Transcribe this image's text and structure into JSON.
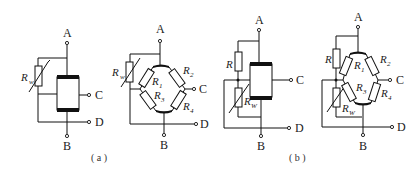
{
  "figure": {
    "caption_a": "( a )",
    "caption_b": "( b )",
    "terminals": {
      "A": "A",
      "B": "B",
      "C": "C",
      "D": "D"
    },
    "components": {
      "rw_main": "R",
      "rw_sub": "w",
      "r": "R",
      "r1_main": "R",
      "r1_sub": "1",
      "r2_main": "R",
      "r2_sub": "2",
      "r3_main": "R",
      "r3_sub": "3",
      "r4_main": "R",
      "r4_sub": "4",
      "rW_main": "R",
      "rW_sub": "W"
    }
  }
}
